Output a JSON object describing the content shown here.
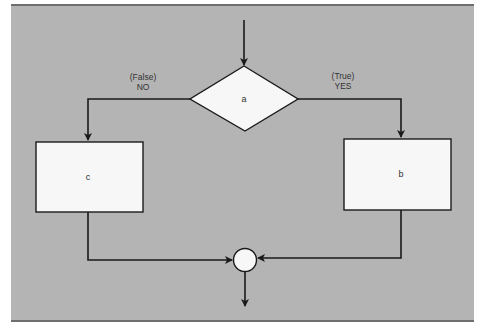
{
  "diagram": {
    "type": "flowchart",
    "title": "",
    "colors": {
      "background": "#b4b4b4",
      "border": "#6e6e6e",
      "node_fill": "#f7f7f7",
      "stroke": "#1a1a1a",
      "text": "#333333"
    },
    "nodes": {
      "decision": {
        "id": "a",
        "shape": "diamond",
        "label": "a"
      },
      "true_process": {
        "id": "b",
        "shape": "rectangle",
        "label": "b"
      },
      "false_process": {
        "id": "c",
        "shape": "rectangle",
        "label": "c"
      },
      "junction": {
        "id": "join",
        "shape": "circle",
        "label": ""
      }
    },
    "branches": {
      "false": {
        "line1": "(False)",
        "line2": "NO",
        "target": "c"
      },
      "true": {
        "line1": "(True)",
        "line2": "YES",
        "target": "b"
      }
    },
    "edges": [
      {
        "from": "entry",
        "to": "a"
      },
      {
        "from": "a",
        "to": "c",
        "label": "(False) NO"
      },
      {
        "from": "a",
        "to": "b",
        "label": "(True) YES"
      },
      {
        "from": "c",
        "to": "join"
      },
      {
        "from": "b",
        "to": "join"
      },
      {
        "from": "join",
        "to": "exit"
      }
    ]
  }
}
